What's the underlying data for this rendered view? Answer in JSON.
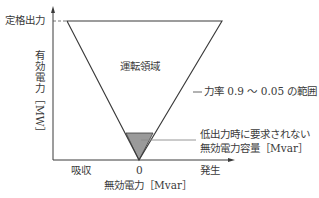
{
  "diagram": {
    "y_axis": {
      "label": "有効電力［MW］",
      "rated_label": "定格出力"
    },
    "x_axis": {
      "label": "無効電力［Mvar］",
      "left_label": "吸収",
      "right_label": "発生",
      "origin_label": "0"
    },
    "region": {
      "label": "運転領域"
    },
    "callouts": {
      "power_factor": "力率 0.9 ～ 0.05 の範囲",
      "low_output_line1": "低出力時に要求されない",
      "low_output_line2": "無効電力容量［Mvar］"
    },
    "colors": {
      "line": "#3a3a3a",
      "shade": "#9a9a9a",
      "callout_line": "#8a8a8a"
    }
  }
}
